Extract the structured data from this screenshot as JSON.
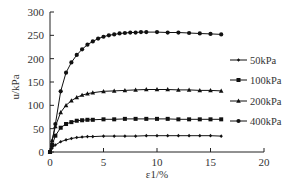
{
  "chart_data": {
    "type": "line",
    "title": "",
    "xlabel": "ε1/%",
    "ylabel": "u/kPa",
    "xlim": [
      0,
      20
    ],
    "ylim": [
      0,
      300
    ],
    "xticks": [
      0,
      5,
      10,
      15,
      20
    ],
    "yticks": [
      0,
      50,
      100,
      150,
      200,
      250,
      300
    ],
    "grid": false,
    "legend_position": "right",
    "series": [
      {
        "name": "50kPa",
        "marker": "diamond",
        "x": [
          0,
          0.2,
          0.5,
          1,
          1.5,
          2,
          2.5,
          3,
          3.5,
          4,
          5,
          6,
          7,
          8,
          9,
          10,
          11,
          12,
          13,
          14,
          15,
          16
        ],
        "values": [
          0,
          8,
          15,
          22,
          26,
          29,
          31,
          32,
          33,
          33,
          34,
          34,
          34,
          34,
          35,
          35,
          35,
          35,
          35,
          35,
          35,
          34
        ]
      },
      {
        "name": "100kPa",
        "marker": "square",
        "x": [
          0,
          0.2,
          0.5,
          1,
          1.5,
          2,
          2.5,
          3,
          3.5,
          4,
          5,
          6,
          7,
          8,
          9,
          10,
          11,
          12,
          13,
          14,
          15,
          16
        ],
        "values": [
          0,
          15,
          35,
          52,
          60,
          64,
          67,
          68,
          69,
          69,
          70,
          70,
          71,
          71,
          71,
          71,
          71,
          70,
          70,
          70,
          70,
          70
        ]
      },
      {
        "name": "200kPa",
        "marker": "triangle",
        "x": [
          0,
          0.2,
          0.5,
          1,
          1.5,
          2,
          2.5,
          3,
          3.5,
          4,
          5,
          6,
          7,
          8,
          9,
          10,
          11,
          12,
          13,
          14,
          15,
          16
        ],
        "values": [
          0,
          25,
          55,
          85,
          100,
          110,
          117,
          122,
          125,
          127,
          130,
          131,
          132,
          133,
          134,
          134,
          134,
          133,
          133,
          132,
          132,
          131
        ]
      },
      {
        "name": "400kPa",
        "marker": "circle",
        "x": [
          0,
          0.5,
          1,
          1.5,
          2,
          2.5,
          3,
          3.5,
          4,
          4.5,
          5,
          5.5,
          6,
          6.5,
          7,
          7.5,
          8,
          8.5,
          9,
          10,
          11,
          12,
          13,
          14,
          15,
          16
        ],
        "values": [
          0,
          60,
          130,
          170,
          192,
          208,
          220,
          230,
          237,
          243,
          247,
          250,
          252,
          254,
          255,
          256,
          256,
          257,
          257,
          257,
          256,
          256,
          255,
          254,
          253,
          252
        ]
      }
    ]
  }
}
